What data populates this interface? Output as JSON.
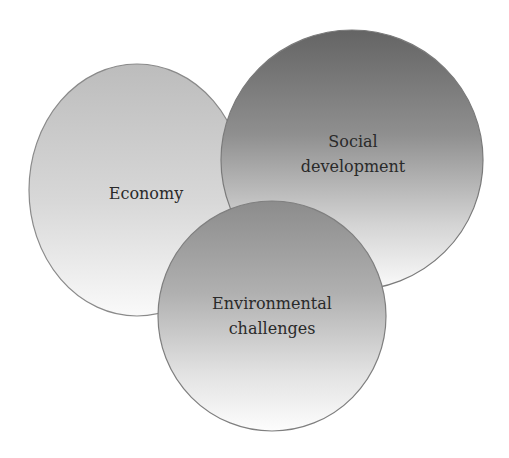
{
  "diagram": {
    "type": "venn-overlapping-circles",
    "nodes": [
      {
        "id": "economy",
        "label_lines": [
          "Economy"
        ],
        "shape": "ellipse",
        "cx": 137,
        "cy": 190,
        "rx": 108,
        "ry": 126,
        "gradient": {
          "top": "#bcbcbc",
          "bottom": "#fafafa"
        },
        "stroke": "#8a8a8a",
        "z_order": 1
      },
      {
        "id": "social-development",
        "label_lines": [
          "Social",
          "development"
        ],
        "shape": "circle",
        "cx": 352,
        "cy": 160,
        "rx": 131,
        "ry": 130,
        "gradient": {
          "top": "#646464",
          "bottom": "#fbfbfb"
        },
        "stroke": "#7a7a7a",
        "z_order": 2
      },
      {
        "id": "environmental-challenges",
        "label_lines": [
          "Environmental",
          "challenges"
        ],
        "shape": "circle",
        "cx": 272,
        "cy": 316,
        "rx": 114,
        "ry": 115,
        "gradient": {
          "top": "#8c8c8c",
          "bottom": "#fdfdfd"
        },
        "stroke": "#7f7f7f",
        "z_order": 3
      }
    ],
    "labels": {
      "economy": {
        "line1": "Economy",
        "x": 146,
        "y1": 199
      },
      "social": {
        "line1": "Social",
        "line2": "development",
        "x": 353,
        "y1": 147,
        "y2": 172
      },
      "environmental": {
        "line1": "Environmental",
        "line2": "challenges",
        "x": 272,
        "y1": 309,
        "y2": 334
      }
    },
    "colors": {
      "background": "#ffffff",
      "text": "#2a2a2a"
    }
  }
}
